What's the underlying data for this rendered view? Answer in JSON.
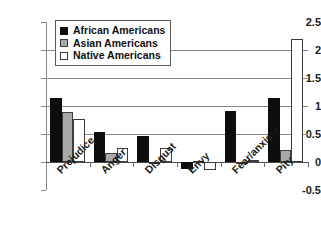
{
  "chart_data": {
    "type": "bar",
    "title": "",
    "xlabel": "",
    "ylabel": "",
    "categories": [
      "Prejudice",
      "Anger",
      "Disgust",
      "Envy",
      "Fear/anxiety",
      "Pity"
    ],
    "series": [
      {
        "name": "African Americans",
        "color": "#0d0d0d",
        "values": [
          1.15,
          0.54,
          0.47,
          -0.13,
          0.91,
          1.15
        ]
      },
      {
        "name": "Asian Americans",
        "color": "#a8a8a8",
        "values": [
          0.9,
          0.16,
          -0.01,
          0.02,
          -0.03,
          0.22
        ]
      },
      {
        "name": "Native Americans",
        "color": "#ffffff",
        "values": [
          0.77,
          0.25,
          0.25,
          -0.14,
          0.04,
          2.19
        ]
      }
    ],
    "ylim": [
      -0.5,
      2.5
    ],
    "yticks": [
      2.5,
      2,
      1.5,
      1,
      0.5,
      0,
      -0.5
    ],
    "ytick_labels": [
      "2.5",
      "2",
      "1.5",
      "1",
      "0.5",
      "0",
      "-0.5"
    ],
    "grid": true,
    "legend_position": "upper-left"
  }
}
